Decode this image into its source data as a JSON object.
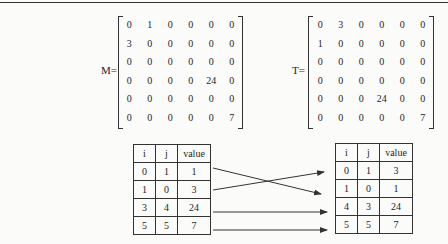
{
  "matrix_m": {
    "label": "M=",
    "rows": [
      [
        "0",
        "1",
        "0",
        "0",
        "0",
        "0"
      ],
      [
        "3",
        "0",
        "0",
        "0",
        "0",
        "0"
      ],
      [
        "0",
        "0",
        "0",
        "0",
        "0",
        "0"
      ],
      [
        "0",
        "0",
        "0",
        "0",
        "24",
        "0"
      ],
      [
        "0",
        "0",
        "0",
        "0",
        "0",
        "0"
      ],
      [
        "0",
        "0",
        "0",
        "0",
        "0",
        "7"
      ]
    ]
  },
  "matrix_t": {
    "label": "T=",
    "rows": [
      [
        "0",
        "3",
        "0",
        "0",
        "0",
        "0"
      ],
      [
        "1",
        "0",
        "0",
        "0",
        "0",
        "0"
      ],
      [
        "0",
        "0",
        "0",
        "0",
        "0",
        "0"
      ],
      [
        "0",
        "0",
        "0",
        "0",
        "0",
        "0"
      ],
      [
        "0",
        "0",
        "0",
        "24",
        "0",
        "0"
      ],
      [
        "0",
        "0",
        "0",
        "0",
        "0",
        "7"
      ]
    ]
  },
  "triple_m": {
    "headers": [
      "i",
      "j",
      "value"
    ],
    "rows": [
      [
        "0",
        "1",
        "1"
      ],
      [
        "1",
        "0",
        "3"
      ],
      [
        "3",
        "4",
        "24"
      ],
      [
        "5",
        "5",
        "7"
      ]
    ]
  },
  "triple_t": {
    "headers": [
      "i",
      "j",
      "value"
    ],
    "rows": [
      [
        "0",
        "1",
        "3"
      ],
      [
        "1",
        "0",
        "1"
      ],
      [
        "4",
        "3",
        "24"
      ],
      [
        "5",
        "5",
        "7"
      ]
    ]
  },
  "colors": {
    "ink": "#1e1e1e",
    "rule": "#333333",
    "paper": "#fbfbfa"
  }
}
